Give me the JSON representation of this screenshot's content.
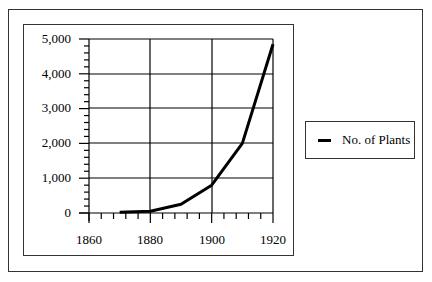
{
  "chart_data": {
    "type": "line",
    "title": "",
    "xlabel": "",
    "ylabel": "",
    "x": [
      1870,
      1880,
      1890,
      1900,
      1910,
      1920
    ],
    "series": [
      {
        "name": "No. of Plants",
        "values": [
          20,
          50,
          250,
          800,
          2000,
          4850
        ]
      }
    ],
    "xlim": [
      1860,
      1920
    ],
    "ylim": [
      0,
      5000
    ],
    "x_ticks": [
      "1860",
      "1880",
      "1900",
      "1920"
    ],
    "y_ticks": [
      "0",
      "1,000",
      "2,000",
      "3,000",
      "4,000",
      "5,000"
    ],
    "grid": true,
    "legend_position": "right"
  },
  "legend": {
    "items": [
      {
        "label": "No. of Plants",
        "color": "#000000"
      }
    ]
  },
  "axes": {
    "y_labels": [
      "5,000",
      "4,000",
      "3,000",
      "2,000",
      "1,000",
      "0"
    ],
    "x_labels": [
      "1860",
      "1880",
      "1900",
      "1920"
    ]
  }
}
